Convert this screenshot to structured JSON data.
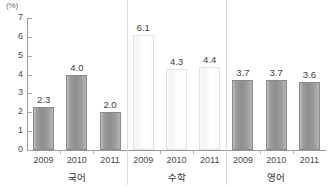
{
  "chart_data": {
    "type": "bar",
    "title": "",
    "subtitle": "",
    "unit_label": "(%)",
    "xlabel": "",
    "ylabel": "",
    "ylim": [
      0,
      7
    ],
    "y_ticks": [
      "0",
      "1",
      "2",
      "3",
      "4",
      "5",
      "6",
      "7"
    ],
    "grid": false,
    "legend": "none",
    "categories": [
      "2009",
      "2010",
      "2011"
    ],
    "groups": [
      {
        "name": "국어",
        "style": "dark",
        "categories": [
          "2009",
          "2010",
          "2011"
        ],
        "values": [
          2.3,
          4.0,
          2.0
        ],
        "labels": [
          "2.3",
          "4.0",
          "2.0"
        ]
      },
      {
        "name": "수학",
        "style": "light",
        "categories": [
          "2009",
          "2010",
          "2011"
        ],
        "values": [
          6.1,
          4.3,
          4.4
        ],
        "labels": [
          "6.1",
          "4.3",
          "4.4"
        ]
      },
      {
        "name": "영어",
        "style": "dark",
        "categories": [
          "2009",
          "2010",
          "2011"
        ],
        "values": [
          3.7,
          3.7,
          3.6
        ],
        "labels": [
          "3.7",
          "3.7",
          "3.6"
        ]
      }
    ],
    "colors": {
      "bar_dark": "#9a9a9a",
      "bar_dark_border": "#8a8a8a",
      "bar_light": "#ffffff",
      "bar_light_border": "#e2e2e2",
      "axis": "#9a9a9a",
      "text": "#3c3c3c",
      "separator": "#dcdcdc"
    }
  }
}
